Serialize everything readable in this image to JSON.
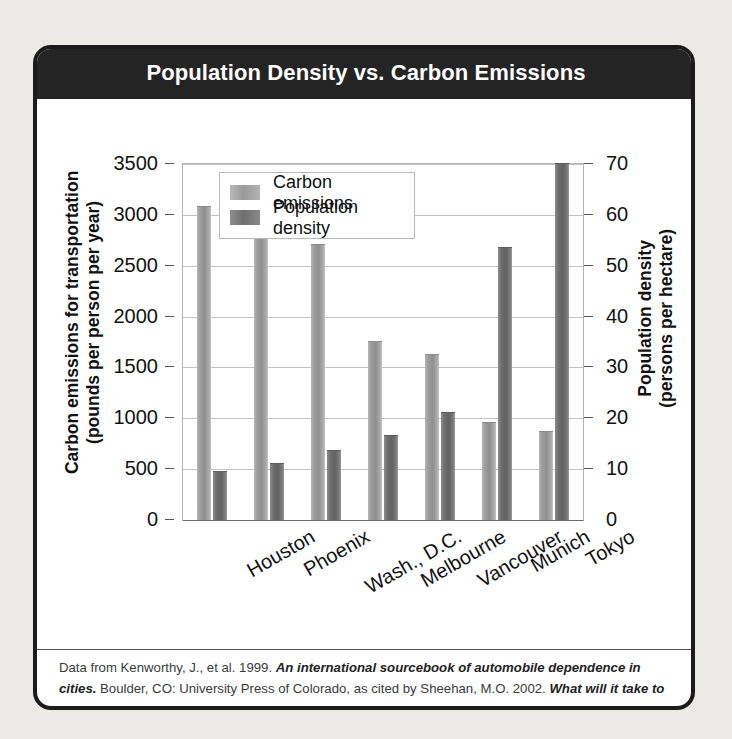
{
  "figure": {
    "title": "Population Density vs. Carbon Emissions",
    "caption_parts": [
      {
        "text": "Data from Kenworthy, J., et al. 1999. ",
        "style": "normal"
      },
      {
        "text": "An international sourcebook of automobile dependence in cities.",
        "style": "bold-italic"
      },
      {
        "text": " Boulder, CO: University Press of Colorado, as cited by Sheehan, M.O. 2002. ",
        "style": "normal"
      },
      {
        "text": "What will it take to halt sprawl?",
        "style": "bold-italic"
      },
      {
        "text": " Washington DC: Worldwatch Institute.",
        "style": "normal"
      }
    ],
    "caption_plain": "Data from Kenworthy, J., et al. 1999. An international sourcebook of automobile dependence in cities. Boulder, CO: University Press of Colorado, as cited by Sheehan, M.O. 2002. What will it take to halt sprawl? Washington DC: Worldwatch Institute."
  },
  "colors": {
    "title_band": "#242424",
    "border": "#1b1b1b",
    "page_background": "#eceae7",
    "emissions_bar": "#9a9a9a",
    "density_bar": "#6f6f6f",
    "gridline": "#c2c2c2"
  },
  "chart_data": {
    "type": "bar",
    "title": "Population Density vs. Carbon Emissions",
    "xlabel": "",
    "ylabel": "Carbon emissions for transportation (pounds per person per year)",
    "y2label": "Population density (persons per hectare)",
    "categories": [
      "Houston",
      "Phoenix",
      "Wash., D.C.",
      "Melbourne",
      "Vancouver",
      "Munich",
      "Tokyo"
    ],
    "series": [
      {
        "name": "Carbon emissions",
        "axis": "left",
        "unit": "pounds per person per year",
        "color": "#9a9a9a",
        "values": [
          3080,
          2810,
          2700,
          1750,
          1620,
          950,
          870
        ]
      },
      {
        "name": "Population density",
        "axis": "right",
        "unit": "persons per hectare",
        "color": "#6f6f6f",
        "values": [
          9.5,
          11,
          13.5,
          16.5,
          21,
          53.5,
          70
        ]
      }
    ],
    "ylim": [
      0,
      3500
    ],
    "y2lim": [
      0,
      70
    ],
    "yticks": [
      0,
      500,
      1000,
      1500,
      2000,
      2500,
      3000,
      3500
    ],
    "y2ticks": [
      0,
      10,
      20,
      30,
      40,
      50,
      60,
      70
    ],
    "ytick_labels": [
      "0",
      "500",
      "1000",
      "1500",
      "2000",
      "2500",
      "3000",
      "3500"
    ],
    "y2tick_labels": [
      "0",
      "10",
      "20",
      "30",
      "40",
      "50",
      "60",
      "70"
    ],
    "grid": true,
    "legend": [
      "Carbon emissions",
      "Population density"
    ],
    "legend_position": "top-left inside plot area",
    "xtick_rotation": -30
  }
}
